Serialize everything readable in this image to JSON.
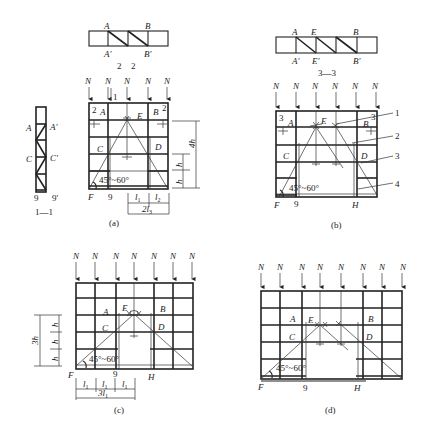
{
  "figure": {
    "load_symbol": "N",
    "angle_label": "45°~60°",
    "panels": {
      "a": {
        "caption": "(a)",
        "plan_labels": {
          "top_left": "A",
          "top_right": "B",
          "bottom_left": "A'",
          "bottom_right": "B'"
        },
        "section_marks": [
          "2",
          "2"
        ],
        "section_mark_1": "1",
        "node_labels": {
          "A": "A",
          "B": "B",
          "C": "C",
          "D": "D",
          "E": "E",
          "F": "F",
          "9": "9"
        },
        "corner_marks": {
          "left": "2",
          "right": "2"
        },
        "dims": {
          "h1": "h",
          "h2": "h",
          "total": "4h",
          "l1": "l",
          "l1_sub": "1",
          "l2": "l",
          "l2_sub": "2",
          "l3": "2l",
          "l3_sub": "3"
        }
      },
      "section_1_1": {
        "caption": "1—1",
        "labels": {
          "A": "A",
          "A_prime": "A'",
          "C": "C",
          "C_prime": "C'",
          "bottom_left": "9",
          "bottom_right": "9'"
        }
      },
      "b": {
        "caption": "(b)",
        "section_caption": "3—3",
        "plan_labels": {
          "A": "A",
          "E": "E",
          "B": "B",
          "A_prime": "A'",
          "E_prime": "E'",
          "B_prime": "B'"
        },
        "node_labels": {
          "A": "A",
          "B": "B",
          "C": "C",
          "D": "D",
          "E": "E",
          "F": "F",
          "H": "H",
          "9": "9"
        },
        "corner_marks": {
          "left": "3",
          "right": "3"
        },
        "callouts": [
          "1",
          "2",
          "3",
          "4"
        ]
      },
      "c": {
        "caption": "(c)",
        "node_labels": {
          "A": "A",
          "B": "B",
          "C": "C",
          "D": "D",
          "E": "E",
          "F": "F",
          "H": "H",
          "9": "9"
        },
        "dims": {
          "h": "h",
          "total": "3h",
          "l1": "l",
          "l1_sub": "1",
          "total_l": "3l",
          "total_l_sub": "1"
        }
      },
      "d": {
        "caption": "(d)",
        "node_labels": {
          "A": "A",
          "B": "B",
          "C": "C",
          "D": "D",
          "E": "E",
          "F": "F",
          "H": "H",
          "9": "9"
        }
      }
    }
  }
}
